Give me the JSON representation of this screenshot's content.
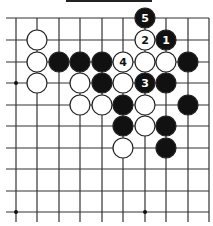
{
  "diagram": {
    "type": "go-board-fragment",
    "top_bar_color": "#222222",
    "grid": {
      "cols_x": [
        16,
        37,
        59,
        80,
        102,
        123,
        145,
        166,
        188,
        209
      ],
      "rows_y": [
        18,
        40,
        62,
        83,
        105,
        126,
        148,
        169,
        191,
        212
      ],
      "top_edge": true,
      "right_edge": true,
      "line_color": "#333333",
      "star_points": [
        [
          0,
          3
        ],
        [
          0,
          9
        ],
        [
          6,
          9
        ]
      ]
    },
    "stone_radius": 10,
    "colors": {
      "black": "#111111",
      "white": "#ffffff",
      "stone_outline": "#222222"
    },
    "stones": [
      {
        "col": 6,
        "row": 0,
        "color": "black",
        "label": "5"
      },
      {
        "col": 1,
        "row": 1,
        "color": "white",
        "label": ""
      },
      {
        "col": 6,
        "row": 1,
        "color": "white",
        "label": "2"
      },
      {
        "col": 7,
        "row": 1,
        "color": "black",
        "label": "1"
      },
      {
        "col": 1,
        "row": 2,
        "color": "white",
        "label": ""
      },
      {
        "col": 2,
        "row": 2,
        "color": "black",
        "label": ""
      },
      {
        "col": 3,
        "row": 2,
        "color": "black",
        "label": ""
      },
      {
        "col": 4,
        "row": 2,
        "color": "black",
        "label": ""
      },
      {
        "col": 5,
        "row": 2,
        "color": "white",
        "label": "4"
      },
      {
        "col": 6,
        "row": 2,
        "color": "white",
        "label": ""
      },
      {
        "col": 7,
        "row": 2,
        "color": "white",
        "label": ""
      },
      {
        "col": 8,
        "row": 2,
        "color": "black",
        "label": ""
      },
      {
        "col": 1,
        "row": 3,
        "color": "white",
        "label": ""
      },
      {
        "col": 3,
        "row": 3,
        "color": "white",
        "label": ""
      },
      {
        "col": 4,
        "row": 3,
        "color": "black",
        "label": ""
      },
      {
        "col": 5,
        "row": 3,
        "color": "white",
        "label": ""
      },
      {
        "col": 6,
        "row": 3,
        "color": "black",
        "label": "3"
      },
      {
        "col": 7,
        "row": 3,
        "color": "black",
        "label": ""
      },
      {
        "col": 3,
        "row": 4,
        "color": "white",
        "label": ""
      },
      {
        "col": 4,
        "row": 4,
        "color": "white",
        "label": ""
      },
      {
        "col": 5,
        "row": 4,
        "color": "black",
        "label": ""
      },
      {
        "col": 6,
        "row": 4,
        "color": "white",
        "label": ""
      },
      {
        "col": 8,
        "row": 4,
        "color": "black",
        "label": ""
      },
      {
        "col": 5,
        "row": 5,
        "color": "black",
        "label": ""
      },
      {
        "col": 6,
        "row": 5,
        "color": "white",
        "label": ""
      },
      {
        "col": 7,
        "row": 5,
        "color": "black",
        "label": ""
      },
      {
        "col": 5,
        "row": 6,
        "color": "white",
        "label": ""
      },
      {
        "col": 7,
        "row": 6,
        "color": "black",
        "label": ""
      }
    ]
  }
}
